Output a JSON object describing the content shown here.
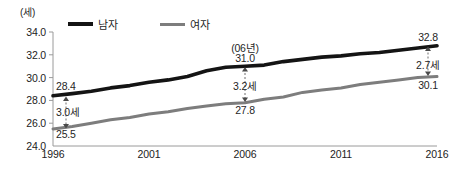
{
  "chart_data": {
    "type": "line",
    "title": "",
    "subtitle": "",
    "xlabel": "",
    "ylabel": "",
    "unit_label": "(세)",
    "x": [
      1996,
      1997,
      1998,
      1999,
      2000,
      2001,
      2002,
      2003,
      2004,
      2005,
      2006,
      2007,
      2008,
      2009,
      2010,
      2011,
      2012,
      2013,
      2014,
      2015,
      2016
    ],
    "xticks": [
      "1996",
      "2001",
      "2006",
      "2011",
      "2016"
    ],
    "xlim": [
      1996,
      2016
    ],
    "yticks": [
      "24.0",
      "26.0",
      "28.0",
      "30.0",
      "32.0",
      "34.0"
    ],
    "ylim": [
      24.0,
      34.0
    ],
    "grid": false,
    "legend_position": "top-left",
    "series": [
      {
        "name": "남자",
        "color": "#141414",
        "values": [
          28.4,
          28.6,
          28.8,
          29.1,
          29.3,
          29.6,
          29.8,
          30.1,
          30.6,
          30.9,
          31.0,
          31.1,
          31.4,
          31.6,
          31.8,
          31.9,
          32.1,
          32.2,
          32.4,
          32.6,
          32.8
        ]
      },
      {
        "name": "여자",
        "color": "#7d7d7d",
        "values": [
          25.5,
          25.7,
          26.0,
          26.3,
          26.5,
          26.8,
          27.0,
          27.3,
          27.5,
          27.7,
          27.8,
          28.1,
          28.3,
          28.7,
          28.9,
          29.1,
          29.4,
          29.6,
          29.8,
          30.0,
          30.1
        ]
      }
    ],
    "annotations": [
      {
        "id": "start",
        "x": 1996,
        "male_value": "28.4",
        "female_value": "25.5",
        "gap": "3.0세",
        "year_note": ""
      },
      {
        "id": "mid",
        "x": 2006,
        "male_value": "31.0",
        "female_value": "27.8",
        "gap": "3.2세",
        "year_note": "(06년)"
      },
      {
        "id": "end",
        "x": 2016,
        "male_value": "32.8",
        "female_value": "30.1",
        "gap": "2.7세",
        "year_note": ""
      }
    ]
  },
  "axes": {
    "unit": "(세)",
    "y_labels": [
      "34.0",
      "32.0",
      "30.0",
      "28.0",
      "26.0",
      "24.0"
    ],
    "x_labels": [
      "1996",
      "2001",
      "2006",
      "2011",
      "2016"
    ]
  },
  "legend": {
    "male": "남자",
    "female": "여자"
  },
  "annotations": {
    "start_male": "28.4",
    "start_gap": "3.0세",
    "start_female": "25.5",
    "mid_year": "(06년)",
    "mid_male": "31.0",
    "mid_gap": "3.2세",
    "mid_female": "27.8",
    "end_male": "32.8",
    "end_gap": "2.7세",
    "end_female": "30.1"
  },
  "colors": {
    "male_line": "#141414",
    "female_line": "#7d7d7d",
    "axis": "#9a9a9a",
    "text": "#1f1f1f",
    "background": "#ffffff"
  }
}
